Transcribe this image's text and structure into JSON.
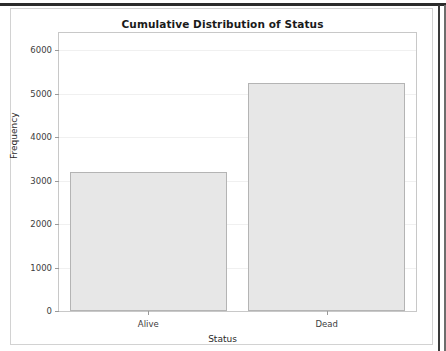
{
  "window": {
    "background_color": "#ffffff",
    "chrome_band_color": "#2b2b2b"
  },
  "panel": {
    "border_color": "#d2d2d2"
  },
  "chart_data": {
    "type": "bar",
    "title": "Cumulative Distribution of Status",
    "xlabel": "Status",
    "ylabel": "Frequency",
    "categories": [
      "Alive",
      "Dead"
    ],
    "values": [
      3200,
      5250
    ],
    "ylim": [
      0,
      6400
    ],
    "y_ticks": [
      0,
      1000,
      2000,
      3000,
      4000,
      5000,
      6000
    ],
    "y_tick_labels": [
      "0",
      "1000",
      "2000",
      "3000",
      "4000",
      "5000",
      "6000"
    ],
    "grid": true,
    "grid_axis": "y",
    "legend": null,
    "bar_fill_color": "#e7e7e7",
    "bar_edge_color": "#b4b4b4",
    "plot_border_color": "#c8c8c8",
    "grid_color": "#f0f0f0"
  }
}
